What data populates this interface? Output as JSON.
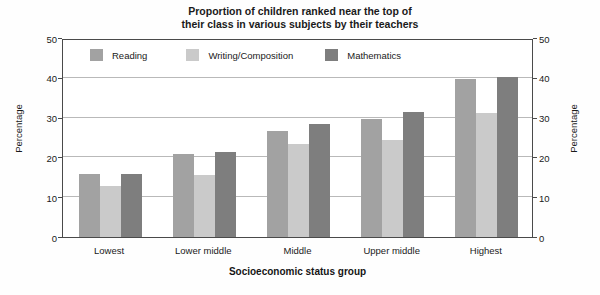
{
  "chart_data": {
    "type": "bar",
    "title": "Proportion of children ranked near the top of their class in various subjects by their teachers",
    "title_lines": [
      "Proportion of children ranked near the top of",
      "their class in various subjects by their teachers"
    ],
    "xlabel": "Socioeconomic status group",
    "ylabel": "Percentage",
    "ylabel_right": "Percentage",
    "categories": [
      "Lowest",
      "Lower middle",
      "Middle",
      "Upper middle",
      "Highest"
    ],
    "series": [
      {
        "name": "Reading",
        "color": "#a2a2a2",
        "values": [
          15.8,
          20.8,
          26.7,
          29.6,
          39.8
        ]
      },
      {
        "name": "Writing/Composition",
        "color": "#cacaca",
        "values": [
          12.8,
          15.7,
          23.4,
          24.5,
          31.2
        ]
      },
      {
        "name": "Mathematics",
        "color": "#7e7e7e",
        "values": [
          15.9,
          21.4,
          28.4,
          31.3,
          40.2
        ]
      }
    ],
    "ylim": [
      0,
      50
    ],
    "yticks": [
      0,
      10,
      20,
      30,
      40,
      50
    ],
    "ytick_labels": [
      "0",
      "10",
      "20",
      "30",
      "40",
      "50"
    ],
    "grid": true,
    "grid_axis": "y",
    "legend_position": "inside-top-left",
    "dual_axis": true
  }
}
